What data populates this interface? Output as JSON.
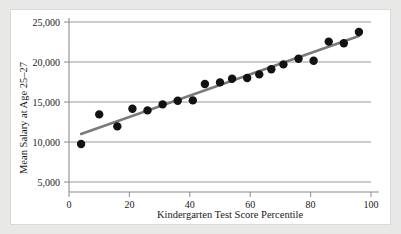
{
  "figure": {
    "background_color": "#ffffff",
    "page_background_color": "#e8e8e6",
    "border_color": "#d9d9d9"
  },
  "chart_data": {
    "type": "scatter",
    "title": "",
    "subtitle": "",
    "xlabel": "Kindergarten Test Score Percentile",
    "ylabel": "Mean Salary at Age 25–27",
    "xlim": [
      0,
      100
    ],
    "ylim": [
      5000,
      25000
    ],
    "xticks": [
      0,
      20,
      40,
      60,
      80,
      100
    ],
    "xtick_labels": [
      "0",
      "20",
      "40",
      "60",
      "80",
      "100"
    ],
    "yticks": [
      5000,
      10000,
      15000,
      20000,
      25000
    ],
    "ytick_labels": [
      "5,000",
      "10,000",
      "15,000",
      "20,000",
      "25,000"
    ],
    "grid": "horizontal",
    "legend": "none",
    "annotations": [],
    "marker_color": "#121212",
    "marker_size": 4.2,
    "series": [
      {
        "name": "Mean salary by kindergarten test score percentile",
        "type": "scatter",
        "x": [
          4,
          10,
          16,
          21,
          26,
          31,
          36,
          41,
          45,
          50,
          54,
          59,
          63,
          67,
          71,
          76,
          81,
          86,
          91,
          96
        ],
        "y": [
          9750,
          13450,
          11950,
          14150,
          13950,
          14700,
          15150,
          15200,
          17250,
          17450,
          17900,
          18000,
          18450,
          19100,
          19700,
          20400,
          20150,
          22550,
          22350,
          23750
        ]
      },
      {
        "name": "Fitted regression line",
        "type": "line",
        "color": "#7a7a7a",
        "x": [
          4,
          96
        ],
        "y": [
          11000,
          23250
        ]
      }
    ]
  }
}
